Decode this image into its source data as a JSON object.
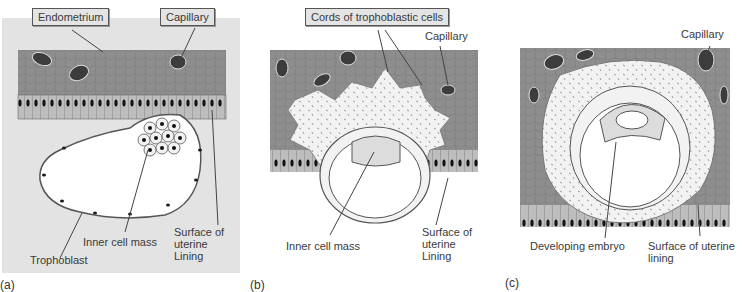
{
  "figure": {
    "panels": [
      {
        "id": "a",
        "caption": "(a)",
        "labels": {
          "endometrium": "Endometrium",
          "capillary": "Capillary",
          "inner_cell_mass": "Inner cell mass",
          "trophoblast": "Trophoblast",
          "surface_line1": "Surface of",
          "surface_line2": "uterine",
          "surface_line3": "Lining"
        }
      },
      {
        "id": "b",
        "caption": "(b)",
        "labels": {
          "cords": "Cords of trophoblastic cells",
          "capillary": "Capillary",
          "inner_cell_mass": "Inner cell mass",
          "surface_line1": "Surface of",
          "surface_line2": "uterine",
          "surface_line3": "Lining"
        }
      },
      {
        "id": "c",
        "caption": "(c)",
        "labels": {
          "capillary": "Capillary",
          "developing_embryo": "Developing embryo",
          "surface_line1": "Surface of uterine",
          "surface_line2": "lining"
        }
      }
    ],
    "colors": {
      "panel_bg": "#e3e3e3",
      "endometrium": "#8e8e8e",
      "epithelium": "#bdbdbd",
      "capillary": "#3c3c3c",
      "trophoblast_fill": "#f2f2f2",
      "cavity": "#ffffff"
    }
  }
}
